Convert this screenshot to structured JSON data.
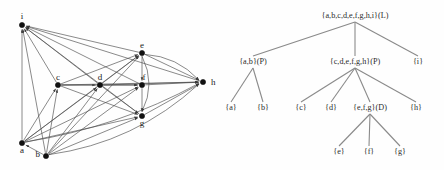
{
  "figure": {
    "background_color": "#fefefe",
    "ink_color": "#111111",
    "edge_color": "#4a4a4a",
    "tree_edge_color": "#8a8a8a"
  },
  "graph": {
    "type": "directed-graph",
    "node_labels": {
      "i": "i",
      "a": "a",
      "b": "b",
      "c": "c",
      "d": "d",
      "e": "e",
      "f": "f",
      "g": "g",
      "h": "h"
    },
    "nodes": [
      {
        "id": "i",
        "label": "i",
        "x": 22,
        "y": 25,
        "label_dx": 0,
        "label_dy": -6,
        "anchor": "middle"
      },
      {
        "id": "a",
        "label": "a",
        "x": 22,
        "y": 143,
        "label_dx": 0,
        "label_dy": 10,
        "anchor": "middle"
      },
      {
        "id": "b",
        "label": "b",
        "x": 46,
        "y": 156,
        "label_dx": -6,
        "label_dy": 1,
        "anchor": "end"
      },
      {
        "id": "c",
        "label": "c",
        "x": 58,
        "y": 85,
        "label_dx": 0,
        "label_dy": -5,
        "anchor": "middle"
      },
      {
        "id": "d",
        "label": "d",
        "x": 100,
        "y": 85,
        "label_dx": 0,
        "label_dy": -5,
        "anchor": "middle"
      },
      {
        "id": "e",
        "label": "e",
        "x": 142,
        "y": 53,
        "label_dx": 0,
        "label_dy": -5,
        "anchor": "middle"
      },
      {
        "id": "f",
        "label": "f",
        "x": 142,
        "y": 85,
        "label_dx": 2,
        "label_dy": -5,
        "anchor": "middle"
      },
      {
        "id": "g",
        "label": "g",
        "x": 142,
        "y": 116,
        "label_dx": 0,
        "label_dy": 10,
        "anchor": "middle"
      },
      {
        "id": "h",
        "label": "h",
        "x": 203,
        "y": 82,
        "label_dx": 8,
        "label_dy": 3,
        "anchor": "start"
      }
    ],
    "edges": [
      {
        "from": "a",
        "to": "i",
        "curve": 0
      },
      {
        "from": "b",
        "to": "i",
        "curve": 0
      },
      {
        "from": "c",
        "to": "i",
        "curve": 0
      },
      {
        "from": "d",
        "to": "i",
        "curve": 0
      },
      {
        "from": "e",
        "to": "i",
        "curve": 0
      },
      {
        "from": "f",
        "to": "i",
        "curve": 0
      },
      {
        "from": "g",
        "to": "i",
        "curve": 0
      },
      {
        "from": "h",
        "to": "i",
        "curve": 0
      },
      {
        "from": "a",
        "to": "c",
        "curve": 0
      },
      {
        "from": "a",
        "to": "d",
        "curve": 0
      },
      {
        "from": "a",
        "to": "e",
        "curve": 0
      },
      {
        "from": "a",
        "to": "f",
        "curve": 0
      },
      {
        "from": "a",
        "to": "g",
        "curve": 0
      },
      {
        "from": "a",
        "to": "h",
        "curve": 16
      },
      {
        "from": "b",
        "to": "c",
        "curve": 0
      },
      {
        "from": "b",
        "to": "d",
        "curve": 0
      },
      {
        "from": "b",
        "to": "e",
        "curve": 0
      },
      {
        "from": "b",
        "to": "f",
        "curve": 0
      },
      {
        "from": "b",
        "to": "g",
        "curve": 0
      },
      {
        "from": "b",
        "to": "h",
        "curve": 26
      },
      {
        "from": "c",
        "to": "d",
        "curve": 0
      },
      {
        "from": "c",
        "to": "e",
        "curve": 0
      },
      {
        "from": "c",
        "to": "f",
        "curve": 0
      },
      {
        "from": "c",
        "to": "g",
        "curve": 0
      },
      {
        "from": "c",
        "to": "h",
        "curve": 0
      },
      {
        "from": "d",
        "to": "e",
        "curve": 0
      },
      {
        "from": "d",
        "to": "f",
        "curve": 0
      },
      {
        "from": "d",
        "to": "g",
        "curve": 0
      },
      {
        "from": "d",
        "to": "h",
        "curve": 0
      },
      {
        "from": "e",
        "to": "f",
        "curve": 0
      },
      {
        "from": "e",
        "to": "g",
        "curve": -14
      },
      {
        "from": "e",
        "to": "h",
        "curve": 0
      },
      {
        "from": "f",
        "to": "g",
        "curve": 0
      },
      {
        "from": "f",
        "to": "h",
        "curve": 0
      },
      {
        "from": "g",
        "to": "h",
        "curve": 0
      },
      {
        "from": "e",
        "to": "h",
        "curve": -12
      },
      {
        "from": "b",
        "to": "a",
        "curve": 0
      }
    ]
  },
  "tree": {
    "type": "hierarchy-tree",
    "nodes": [
      {
        "id": "root",
        "label": "{a,b,c,d,e,f,g,h,i}(L)",
        "x": 133,
        "y": 18,
        "level": 0
      },
      {
        "id": "ab",
        "label": "{a,b}(P)",
        "x": 31,
        "y": 64,
        "level": 1
      },
      {
        "id": "cdefgh",
        "label": "{c,d,e,f,g,h}(P)",
        "x": 133,
        "y": 64,
        "level": 1
      },
      {
        "id": "i",
        "label": "{i}",
        "x": 196,
        "y": 64,
        "level": 1
      },
      {
        "id": "a",
        "label": "{a}",
        "x": 9,
        "y": 110,
        "level": 2
      },
      {
        "id": "b",
        "label": "{b}",
        "x": 41,
        "y": 110,
        "level": 2
      },
      {
        "id": "c",
        "label": "{c}",
        "x": 79,
        "y": 110,
        "level": 2
      },
      {
        "id": "d",
        "label": "{d}",
        "x": 109,
        "y": 110,
        "level": 2
      },
      {
        "id": "efg",
        "label": "{e,f,g}(D)",
        "x": 148,
        "y": 110,
        "level": 2
      },
      {
        "id": "h",
        "label": "{h}",
        "x": 194,
        "y": 110,
        "level": 2
      },
      {
        "id": "e",
        "label": "{e}",
        "x": 117,
        "y": 154,
        "level": 3
      },
      {
        "id": "f",
        "label": "{f}",
        "x": 147,
        "y": 154,
        "level": 3
      },
      {
        "id": "g",
        "label": "{g}",
        "x": 178,
        "y": 154,
        "level": 3
      }
    ],
    "links": [
      {
        "from": "root",
        "to": "ab"
      },
      {
        "from": "root",
        "to": "cdefgh"
      },
      {
        "from": "root",
        "to": "i"
      },
      {
        "from": "ab",
        "to": "a"
      },
      {
        "from": "ab",
        "to": "b"
      },
      {
        "from": "cdefgh",
        "to": "c"
      },
      {
        "from": "cdefgh",
        "to": "d"
      },
      {
        "from": "cdefgh",
        "to": "efg"
      },
      {
        "from": "cdefgh",
        "to": "h"
      },
      {
        "from": "efg",
        "to": "e"
      },
      {
        "from": "efg",
        "to": "f"
      },
      {
        "from": "efg",
        "to": "g"
      }
    ]
  }
}
